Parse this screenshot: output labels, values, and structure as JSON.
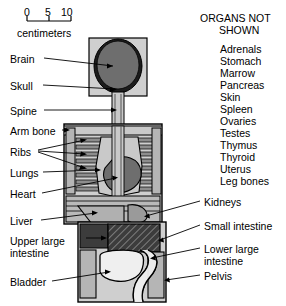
{
  "scale": {
    "ticks": [
      "0",
      "5",
      "10"
    ],
    "unit_label": "centimeters"
  },
  "organs_not_shown": {
    "title_line1": "ORGANS NOT",
    "title_line2": "SHOWN",
    "items": [
      "Adrenals",
      "Stomach",
      "Marrow",
      "Pancreas",
      "Skin",
      "Spleen",
      "Ovaries",
      "Testes",
      "Thymus",
      "Thyroid",
      "Uterus",
      "Leg bones"
    ]
  },
  "left_labels": [
    {
      "text": "Brain"
    },
    {
      "text": "Skull"
    },
    {
      "text": "Spine"
    },
    {
      "text": "Arm bone"
    },
    {
      "text": "Ribs"
    },
    {
      "text": "Lungs"
    },
    {
      "text": "Heart"
    },
    {
      "text": "Liver"
    },
    {
      "text": "Upper large"
    },
    {
      "text": "intestine"
    },
    {
      "text": "Bladder"
    }
  ],
  "right_labels": [
    {
      "text": "Kidneys"
    },
    {
      "text": "Small intestine"
    },
    {
      "text": "Lower large"
    },
    {
      "text": "intestine"
    },
    {
      "text": "Pelvis"
    }
  ],
  "colors": {
    "background": "#ffffff",
    "ink": "#000000",
    "body_fill": "#cfcfcf",
    "bone_fill": "#b5b5b5",
    "organ_light": "#c9c9c9",
    "organ_mid": "#9a9a9a",
    "organ_dark": "#6e6e6e",
    "intestine_dark": "#3c3c3c",
    "white_organ": "#efefef"
  }
}
